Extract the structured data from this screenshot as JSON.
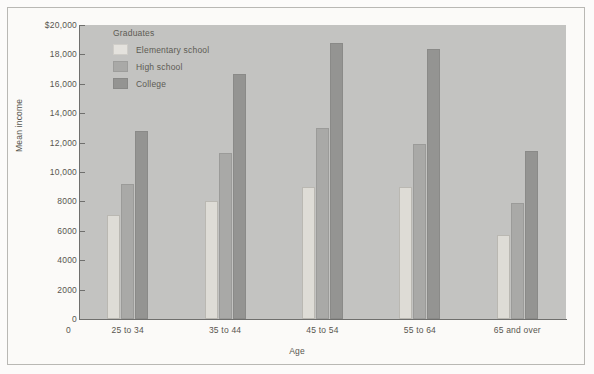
{
  "chart_data": {
    "type": "bar",
    "title": "",
    "xlabel": "Age",
    "ylabel": "Mean income",
    "categories": [
      "25 to 34",
      "35 to 44",
      "45 to 54",
      "55 to 64",
      "65 and over"
    ],
    "legend_title": "Graduates",
    "legend_position": "top-left-inside",
    "grid": false,
    "ylim": [
      0,
      20000
    ],
    "yticks": [
      0,
      2000,
      4000,
      6000,
      8000,
      10000,
      12000,
      14000,
      16000,
      18000,
      20000
    ],
    "ytick_labels": [
      "0",
      "2000",
      "4000",
      "6000",
      "8000",
      "10,000",
      "12,000",
      "14,000",
      "16,000",
      "18,000",
      "$20,000"
    ],
    "xtick_labels": [
      "25 to 34",
      "35 to 44",
      "45 to 54",
      "55 to 64",
      "65 and over"
    ],
    "x_origin_label": "0",
    "series": [
      {
        "name": "Elementary school",
        "color": "#dedcd6",
        "values": [
          7100,
          8000,
          9000,
          9000,
          5700
        ]
      },
      {
        "name": "High school",
        "color": "#a9a9a7",
        "values": [
          9200,
          11300,
          13000,
          11900,
          7900
        ]
      },
      {
        "name": "College",
        "color": "#949492",
        "values": [
          12800,
          16700,
          18800,
          18400,
          11400
        ]
      }
    ]
  },
  "colors": {
    "panel_background": "#c3c3c1",
    "figure_background": "#fbfaf8",
    "axis": "#6f6f6d",
    "text": "#58564f",
    "frame_border": "#b9b8b4"
  }
}
